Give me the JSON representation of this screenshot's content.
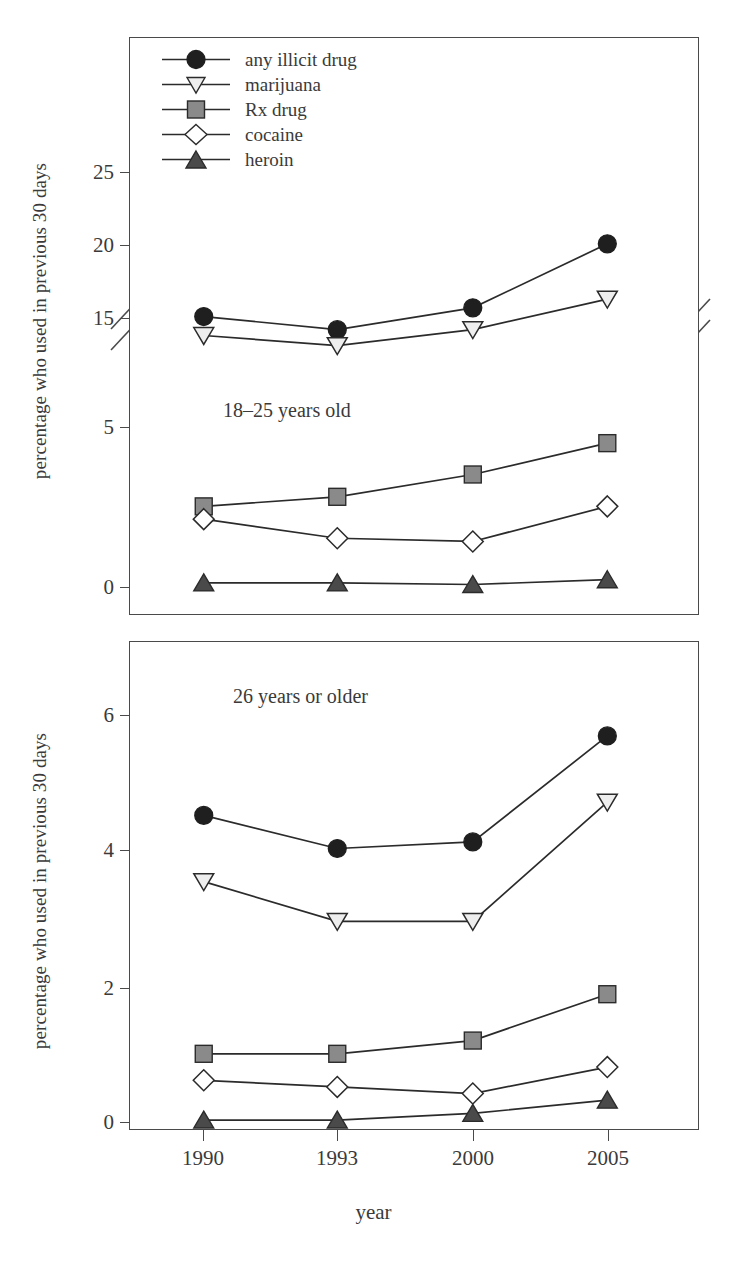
{
  "figure": {
    "ylabel_top": "percentage who used in previous 30 days",
    "ylabel_bottom": "percentage who used in previous 30 days",
    "xlabel": "year",
    "note_top": "18–25 years old",
    "note_bottom": "26 years or older"
  },
  "legend": {
    "position": "top-left inside upper panel",
    "items": [
      {
        "label": "any illicit drug",
        "marker": "filled-circle",
        "color": "#1f1f1f",
        "icon": "circle-marker-icon"
      },
      {
        "label": "marijuana",
        "marker": "open-down-triangle",
        "color": "#eeeeee",
        "icon": "down-triangle-marker-icon"
      },
      {
        "label": "Rx drug",
        "marker": "filled-square",
        "color": "#8a8a8a",
        "icon": "square-marker-icon"
      },
      {
        "label": "cocaine",
        "marker": "open-diamond",
        "color": "#ffffff",
        "icon": "diamond-marker-icon"
      },
      {
        "label": "heroin",
        "marker": "filled-up-triangle",
        "color": "#4a4a4a",
        "icon": "up-triangle-marker-icon"
      }
    ]
  },
  "axis_top": {
    "ticks": [
      "0",
      "5",
      "15",
      "20",
      "25"
    ],
    "broken_axis": true,
    "break_between": [
      5,
      15
    ]
  },
  "axis_bottom": {
    "ticks": [
      "0",
      "2",
      "4",
      "6"
    ]
  },
  "xaxis": {
    "ticks": [
      "1990",
      "1993",
      "2000",
      "2005"
    ]
  },
  "chart_data": [
    {
      "type": "line",
      "title": "18–25 years old",
      "xlabel": "year",
      "ylabel": "percentage who used in previous 30 days",
      "categories": [
        "1990",
        "1993",
        "2000",
        "2005"
      ],
      "x": [
        1990,
        1993,
        2000,
        2005
      ],
      "yticks": [
        0,
        5,
        15,
        20,
        25
      ],
      "ylim": [
        0,
        27
      ],
      "axis_break": [
        5,
        15
      ],
      "grid": false,
      "legend_position": "upper-left inside axes",
      "series": [
        {
          "name": "any illicit drug",
          "marker": "filled-circle",
          "color": "#1f1f1f",
          "values": [
            15.1,
            14.2,
            15.7,
            20.1
          ]
        },
        {
          "name": "marijuana",
          "marker": "open-down-triangle",
          "color": "#eeeeee",
          "values": [
            13.8,
            13.1,
            14.2,
            16.3
          ]
        },
        {
          "name": "Rx drug",
          "marker": "filled-square",
          "color": "#8a8a8a",
          "values": [
            2.5,
            2.8,
            3.5,
            6.4
          ]
        },
        {
          "name": "cocaine",
          "marker": "open-diamond",
          "color": "#ffffff",
          "values": [
            2.1,
            1.5,
            1.4,
            2.5
          ]
        },
        {
          "name": "heroin",
          "marker": "filled-up-triangle",
          "color": "#4a4a4a",
          "values": [
            0.1,
            0.1,
            0.05,
            0.2
          ]
        }
      ]
    },
    {
      "type": "line",
      "title": "26 years or older",
      "xlabel": "year",
      "ylabel": "percentage who used in previous 30 days",
      "categories": [
        "1990",
        "1993",
        "2000",
        "2005"
      ],
      "x": [
        1990,
        1993,
        2000,
        2005
      ],
      "yticks": [
        0,
        2,
        4,
        6
      ],
      "ylim": [
        0,
        6.8
      ],
      "grid": false,
      "legend_position": "none",
      "series": [
        {
          "name": "any illicit drug",
          "marker": "filled-circle",
          "color": "#1f1f1f",
          "values": [
            4.6,
            4.1,
            4.2,
            5.8
          ]
        },
        {
          "name": "marijuana",
          "marker": "open-down-triangle",
          "color": "#eeeeee",
          "values": [
            3.6,
            3.0,
            3.0,
            4.8
          ]
        },
        {
          "name": "Rx drug",
          "marker": "filled-square",
          "color": "#8a8a8a",
          "values": [
            1.0,
            1.0,
            1.2,
            1.9
          ]
        },
        {
          "name": "cocaine",
          "marker": "open-diamond",
          "color": "#ffffff",
          "values": [
            0.6,
            0.5,
            0.4,
            0.8
          ]
        },
        {
          "name": "heroin",
          "marker": "filled-up-triangle",
          "color": "#4a4a4a",
          "values": [
            0.0,
            0.0,
            0.1,
            0.3
          ]
        }
      ]
    }
  ]
}
